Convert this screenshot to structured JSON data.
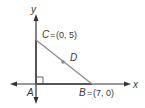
{
  "diagram": {
    "type": "coordinate-geometry",
    "axes": {
      "x_label": "x",
      "y_label": "y"
    },
    "points": {
      "A": {
        "label": "A",
        "coords": ""
      },
      "B": {
        "label": "B",
        "equals": "=",
        "coords": "(7, 0)"
      },
      "C": {
        "label": "C",
        "equals": "=",
        "coords": "(0, 5)"
      },
      "D": {
        "label": "D",
        "coords": ""
      }
    },
    "segments": [
      "CB",
      "AB",
      "AC"
    ],
    "right_angle_at": "A",
    "colors": {
      "axes": "#333333",
      "hypotenuse": "#8a8a8a",
      "point_D": "#8a8a8a",
      "text": "#3a3a3a"
    }
  }
}
